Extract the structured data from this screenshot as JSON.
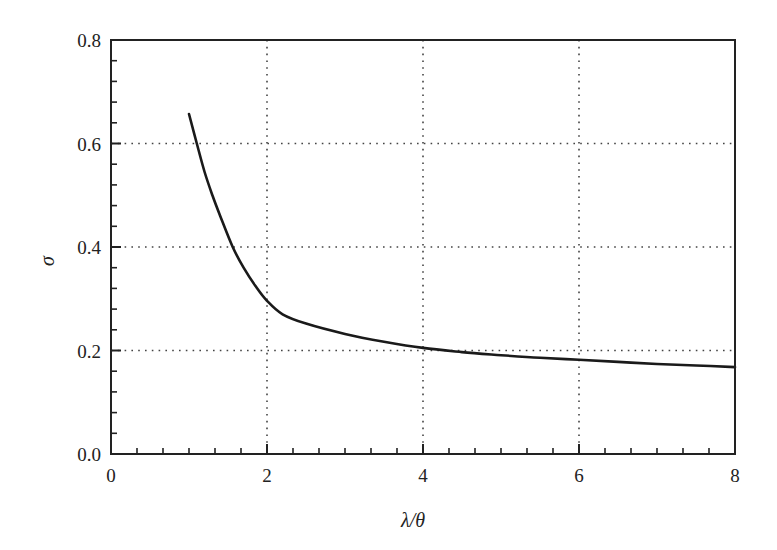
{
  "chart_data": {
    "type": "line",
    "title": "",
    "xlabel": "λ/θ",
    "ylabel": "σ",
    "xlim": [
      0,
      8
    ],
    "ylim": [
      0.0,
      0.8
    ],
    "x_ticks": [
      0,
      2,
      4,
      6,
      8
    ],
    "x_tick_labels": [
      "0",
      "2",
      "4",
      "6",
      "8"
    ],
    "y_ticks": [
      0.0,
      0.2,
      0.4,
      0.6,
      0.8
    ],
    "y_tick_labels": [
      "0.0",
      "0.2",
      "0.4",
      "0.6",
      "0.8"
    ],
    "x_minor_per_major": 5,
    "y_minor_per_major": 4,
    "grid": true,
    "grid_style": "dotted",
    "legend": null,
    "series": [
      {
        "name": "σ",
        "color": "#1a1a1a",
        "x": [
          1.0,
          1.1,
          1.2,
          1.3,
          1.4,
          1.56,
          1.7,
          1.85,
          2.0,
          2.2,
          2.5,
          3.0,
          3.5,
          4.0,
          4.5,
          5.0,
          5.5,
          6.0,
          6.5,
          7.0,
          7.5,
          8.0
        ],
        "y": [
          0.657,
          0.6,
          0.545,
          0.5,
          0.46,
          0.4,
          0.36,
          0.325,
          0.296,
          0.27,
          0.252,
          0.232,
          0.217,
          0.205,
          0.197,
          0.191,
          0.186,
          0.182,
          0.178,
          0.174,
          0.171,
          0.168
        ]
      }
    ]
  }
}
